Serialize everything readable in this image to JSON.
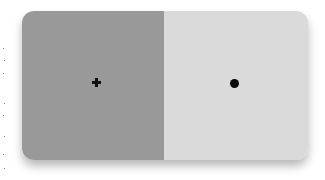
{
  "stimulus": {
    "left_panel": {
      "color": "#999999",
      "marker": "plus-icon",
      "marker_glyph": "+"
    },
    "right_panel": {
      "color": "#dadada",
      "marker": "dot-icon",
      "marker_glyph": "●"
    }
  }
}
